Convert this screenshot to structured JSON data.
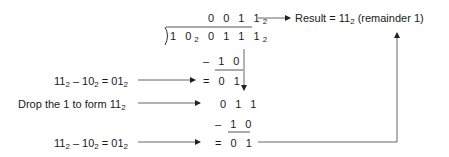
{
  "quotient": {
    "digits": "0 0 1 1",
    "base": "2"
  },
  "divisor": {
    "digits": "1 0",
    "base": "2"
  },
  "dividend": {
    "digits": "0 1 1 1",
    "base": "2"
  },
  "result": {
    "prefix": "Result = 11",
    "base": "2",
    "suffix": " (remainder  1)"
  },
  "steps": [
    {
      "minus_sign": "–",
      "subtrahend": "1 0",
      "equals_sign": "=",
      "difference": "0 1"
    },
    {
      "brought_down": "0 1 1"
    },
    {
      "minus_sign": "–",
      "subtrahend": "1 0",
      "equals_sign": "=",
      "difference": "0 1"
    }
  ],
  "annotations": [
    {
      "a": "11",
      "b": "10",
      "c": "01",
      "base": "2",
      "minus": " – ",
      "eq": " = "
    },
    {
      "text": "Drop the 1 to form 11",
      "base": "2"
    },
    {
      "a": "11",
      "b": "10",
      "c": "01",
      "base": "2",
      "minus": " – ",
      "eq": " = "
    }
  ]
}
